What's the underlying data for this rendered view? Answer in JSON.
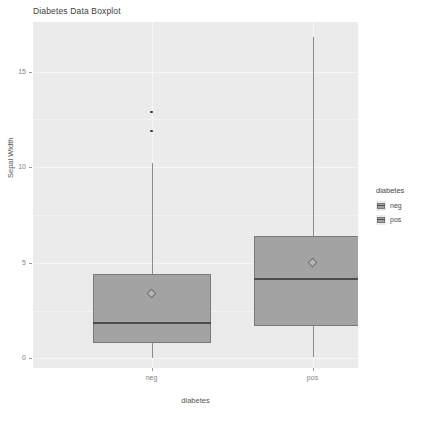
{
  "chart_data": {
    "type": "box",
    "title": "Diabetes Data Boxplot",
    "xlabel": "diabetes",
    "ylabel": "Sepal Width",
    "categories": [
      "neg",
      "pos"
    ],
    "ylim": [
      -0.5,
      17.6
    ],
    "y_ticks": [
      0,
      5,
      10,
      15
    ],
    "y_tick_labels": [
      "0",
      "5",
      "10",
      "15"
    ],
    "grid": true,
    "legend": {
      "title": "diabetes",
      "position": "right",
      "entries": [
        {
          "label": "neg",
          "color": "#a3a3a3"
        },
        {
          "label": "pos",
          "color": "#a3a3a3"
        }
      ]
    },
    "boxes": [
      {
        "category": "neg",
        "lower_whisker": 0.0,
        "q1": 0.8,
        "median": 1.9,
        "q3": 4.4,
        "upper_whisker": 10.2,
        "mean": 3.4,
        "outliers": [
          11.9,
          12.9
        ],
        "fill": "#a3a3a3"
      },
      {
        "category": "pos",
        "lower_whisker": 0.1,
        "q1": 1.7,
        "median": 4.2,
        "q3": 6.4,
        "upper_whisker": 16.8,
        "mean": 5.0,
        "outliers": [],
        "fill": "#a3a3a3"
      }
    ]
  },
  "colors": {
    "panel_background": "#ebebeb",
    "grid_major": "#f6f6f6",
    "box_fill": "#a3a3a3",
    "box_border": "#7a7a7a",
    "median_line": "#4d4d4d",
    "whisker": "#8c8c8c",
    "outlier": "#3a3a3a",
    "mean_marker": "#b7b7b7",
    "axis_text": "#7f7f7f",
    "title_text": "#3d3d3d"
  }
}
